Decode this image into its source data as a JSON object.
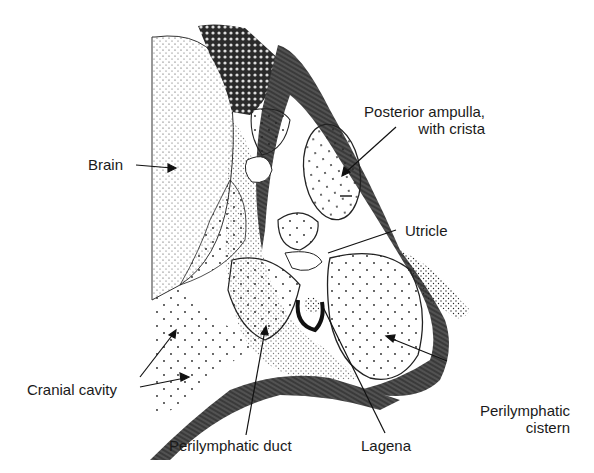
{
  "figure": {
    "labels": {
      "brain": "Brain",
      "posterior_ampulla_line1": "Posterior ampulla,",
      "posterior_ampulla_line2": "with crista",
      "utricle": "Utricle",
      "cranial_cavity": "Cranial cavity",
      "perilymphatic_cistern_line1": "Perilymphatic",
      "perilymphatic_cistern_line2": "cistern",
      "perilymphatic_duct": "Perilymphatic duct",
      "lagena": "Lagena"
    },
    "colors": {
      "ink": "#1a1a1a",
      "background": "#ffffff"
    }
  }
}
